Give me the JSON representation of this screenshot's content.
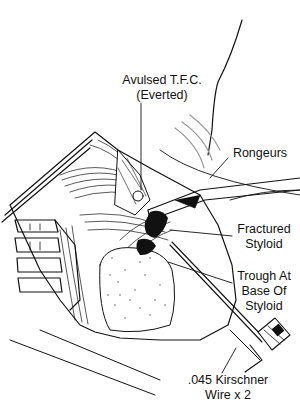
{
  "figure": {
    "style": "black ink line illustration on white background",
    "colors": {
      "ink": "#111111",
      "background": "#ffffff",
      "stipple": "#444444"
    }
  },
  "labels": {
    "tfc": {
      "line1": "Avulsed T.F.C.",
      "line2": "(Everted)"
    },
    "rongeurs": {
      "line1": "Rongeurs"
    },
    "styloid": {
      "line1": "Fractured",
      "line2": "Styloid"
    },
    "trough": {
      "line1": "Trough At",
      "line2": "Base Of",
      "line3": "Styloid"
    },
    "wire": {
      "line1": ".045 Kirschner",
      "line2": "Wire x 2"
    }
  }
}
